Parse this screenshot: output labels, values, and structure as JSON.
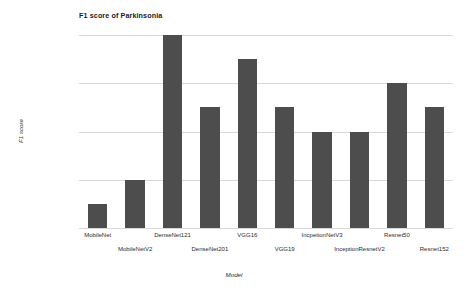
{
  "chart_data": {
    "type": "bar",
    "title": "F1 score of Parkinsonia",
    "xlabel": "Model",
    "ylabel": "F1 score",
    "ylim": [
      0.9,
      0.98
    ],
    "yticks": [
      "0.9",
      "0.92",
      "0.94",
      "0.96",
      "0.98"
    ],
    "ytick_values": [
      0.9,
      0.92,
      0.94,
      0.96,
      0.98
    ],
    "grid": true,
    "legend": null,
    "bar_color": "#4d4d4d",
    "categories": [
      "MobileNet",
      "MobileNetV2",
      "DenseNet121",
      "DenseNet201",
      "VGG16",
      "VGG19",
      "IncpetionNetV3",
      "InceptionResnetV2",
      "Resnet50",
      "Resnet152"
    ],
    "values": [
      0.91,
      0.92,
      0.98,
      0.95,
      0.97,
      0.95,
      0.94,
      0.94,
      0.96,
      0.95
    ]
  }
}
